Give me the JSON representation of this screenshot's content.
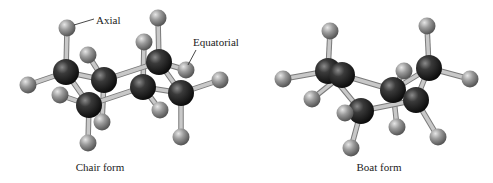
{
  "figure": {
    "background": "#ffffff",
    "colors": {
      "carbon": "#1e1e1e",
      "hydrogen": "#8c8c8c",
      "bond": "#c8c8c8",
      "bond_edge": "#7a7a7a",
      "text": "#222222"
    }
  },
  "chair": {
    "caption": "Chair form",
    "caption_pos": [
      100,
      171
    ],
    "annotations": [
      {
        "text": "Axial",
        "pos": [
          96,
          24
        ],
        "line": [
          [
            74,
            25
          ],
          [
            94,
            19
          ]
        ]
      },
      {
        "text": "Equatorial",
        "pos": [
          193,
          46
        ],
        "line": [
          [
            188,
            65
          ],
          [
            196,
            50
          ]
        ]
      }
    ],
    "carbons": [
      [
        66,
        72
      ],
      [
        104,
        80
      ],
      [
        89,
        105
      ],
      [
        143,
        87
      ],
      [
        159,
        62
      ],
      [
        181,
        93
      ]
    ],
    "ring_bonds": [
      [
        0,
        1
      ],
      [
        1,
        4
      ],
      [
        4,
        5
      ],
      [
        5,
        3
      ],
      [
        3,
        2
      ],
      [
        2,
        0
      ]
    ],
    "hydrogens": [
      {
        "pos": [
          67,
          28
        ],
        "c": 0
      },
      {
        "pos": [
          28,
          85
        ],
        "c": 0
      },
      {
        "pos": [
          88,
          55
        ],
        "c": 1
      },
      {
        "pos": [
          60,
          95
        ],
        "c": 2
      },
      {
        "pos": [
          88,
          143
        ],
        "c": 2
      },
      {
        "pos": [
          102,
          122
        ],
        "c": 1
      },
      {
        "pos": [
          158,
          18
        ],
        "c": 4
      },
      {
        "pos": [
          144,
          42
        ],
        "c": 3
      },
      {
        "pos": [
          186,
          70
        ],
        "c": 4
      },
      {
        "pos": [
          220,
          80
        ],
        "c": 5
      },
      {
        "pos": [
          160,
          110
        ],
        "c": 3
      },
      {
        "pos": [
          181,
          137
        ],
        "c": 5
      }
    ]
  },
  "boat": {
    "caption": "Boat form",
    "caption_pos": [
      379,
      171
    ],
    "carbons": [
      [
        328,
        71
      ],
      [
        342,
        75
      ],
      [
        361,
        111
      ],
      [
        393,
        90
      ],
      [
        416,
        100
      ],
      [
        429,
        68
      ]
    ],
    "ring_bonds": [
      [
        0,
        1
      ],
      [
        1,
        3
      ],
      [
        3,
        5
      ],
      [
        5,
        4
      ],
      [
        4,
        2
      ],
      [
        2,
        0
      ]
    ],
    "hydrogens": [
      {
        "pos": [
          330,
          31
        ],
        "c": 0
      },
      {
        "pos": [
          283,
          79
        ],
        "c": 0
      },
      {
        "pos": [
          312,
          99
        ],
        "c": 1
      },
      {
        "pos": [
          345,
          113
        ],
        "c": 2
      },
      {
        "pos": [
          351,
          148
        ],
        "c": 2
      },
      {
        "pos": [
          427,
          26
        ],
        "c": 5
      },
      {
        "pos": [
          470,
          79
        ],
        "c": 5
      },
      {
        "pos": [
          404,
          71
        ],
        "c": 3
      },
      {
        "pos": [
          397,
          127
        ],
        "c": 3
      },
      {
        "pos": [
          438,
          137
        ],
        "c": 4
      }
    ]
  }
}
